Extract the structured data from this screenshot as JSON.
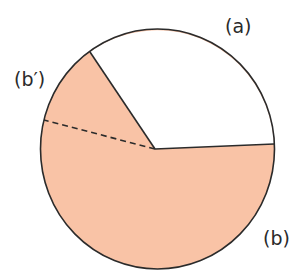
{
  "diagram": {
    "labels": {
      "a": "(a)",
      "b": "(b)",
      "b_prime": "(b′)"
    },
    "colors": {
      "fill_b": "#F9C3A6",
      "fill_a": "#ffffff",
      "stroke": "#2b2b2b"
    },
    "circle": {
      "cx": 157.5,
      "cy": 149,
      "rx": 117,
      "ry": 120
    },
    "center_point": [
      155,
      149
    ],
    "boundary_points": {
      "upper_left": [
        90,
        52
      ],
      "right": [
        274,
        144
      ],
      "dashed_end": [
        44,
        120
      ]
    }
  }
}
